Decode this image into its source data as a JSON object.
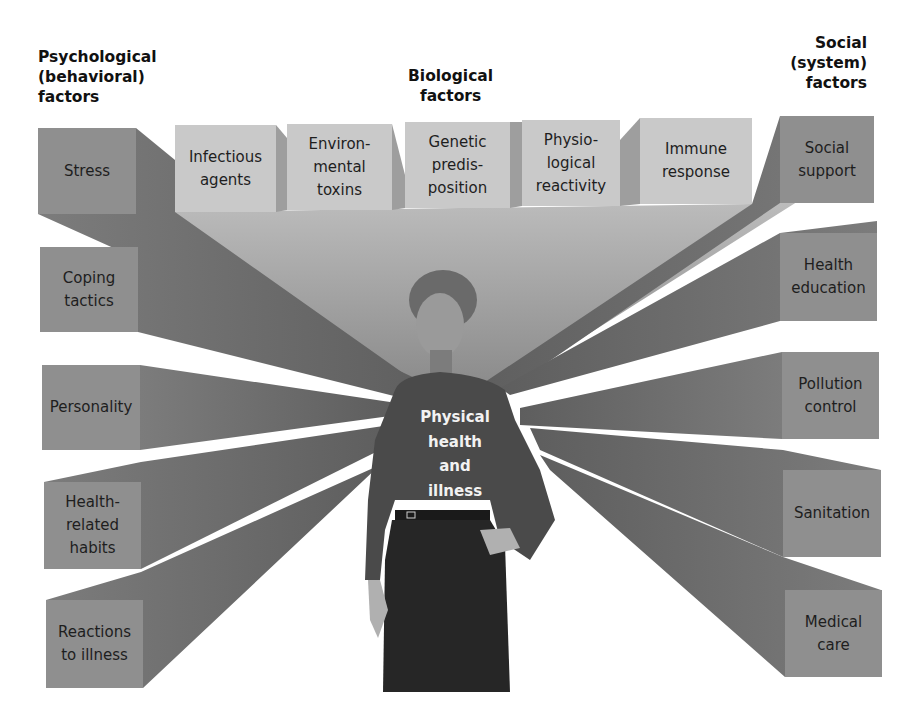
{
  "headings": {
    "psychological": [
      "Psychological",
      "(behavioral)",
      "factors"
    ],
    "biological": [
      "Biological",
      "factors"
    ],
    "social": [
      "Social",
      "(system)",
      "factors"
    ]
  },
  "psychological_factors": [
    {
      "lines": [
        "Stress"
      ]
    },
    {
      "lines": [
        "Coping",
        "tactics"
      ]
    },
    {
      "lines": [
        "Personality"
      ]
    },
    {
      "lines": [
        "Health-",
        "related",
        "habits"
      ]
    },
    {
      "lines": [
        "Reactions",
        "to illness"
      ]
    }
  ],
  "biological_factors": [
    {
      "lines": [
        "Infectious",
        "agents"
      ]
    },
    {
      "lines": [
        "Environ-",
        "mental",
        "toxins"
      ]
    },
    {
      "lines": [
        "Genetic",
        "predis-",
        "position"
      ]
    },
    {
      "lines": [
        "Physio-",
        "logical",
        "reactivity"
      ]
    },
    {
      "lines": [
        "Immune",
        "response"
      ]
    }
  ],
  "social_factors": [
    {
      "lines": [
        "Social",
        "support"
      ]
    },
    {
      "lines": [
        "Health",
        "education"
      ]
    },
    {
      "lines": [
        "Pollution",
        "control"
      ]
    },
    {
      "lines": [
        "Sanitation"
      ]
    },
    {
      "lines": [
        "Medical",
        "care"
      ]
    }
  ],
  "center": {
    "lines": [
      "Physical",
      "health",
      "and",
      "illness"
    ]
  },
  "colors": {
    "side_box": "#8f8f8f",
    "top_box": "#c9c9c9",
    "beam_dark": "#6e6e6e",
    "beam_light": "#b5b5b5",
    "figure_shirt": "#4a4a4a",
    "figure_skirt": "#262626"
  }
}
